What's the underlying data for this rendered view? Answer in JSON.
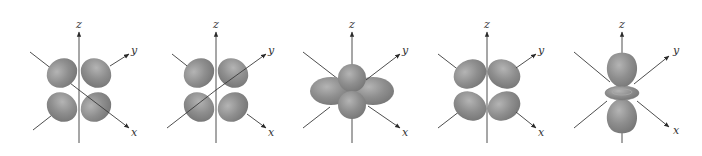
{
  "figure": {
    "background_color": "#ffffff",
    "lobe_color": "#8c8c8c",
    "lobe_highlight_color": "#b0b0b0",
    "lobe_shadow_color": "#707070",
    "axis_color": "#3a3a3a"
  },
  "orbitals": [
    {
      "id": "orbital-1",
      "shape": "four-lobe-cloverleaf",
      "axis_labels": {
        "z": "z",
        "y": "y",
        "x": "x"
      }
    },
    {
      "id": "orbital-2",
      "shape": "four-lobe-cloverleaf",
      "axis_labels": {
        "z": "z",
        "y": "y",
        "x": "x"
      }
    },
    {
      "id": "orbital-3",
      "shape": "four-lobe-along-axes",
      "axis_labels": {
        "z": "z",
        "y": "y",
        "x": "x"
      }
    },
    {
      "id": "orbital-4",
      "shape": "four-lobe-cloverleaf",
      "axis_labels": {
        "z": "z",
        "y": "y",
        "x": "x"
      }
    },
    {
      "id": "orbital-5",
      "shape": "dumbbell-with-torus",
      "axis_labels": {
        "z": "z",
        "y": "y",
        "x": "x"
      }
    }
  ]
}
